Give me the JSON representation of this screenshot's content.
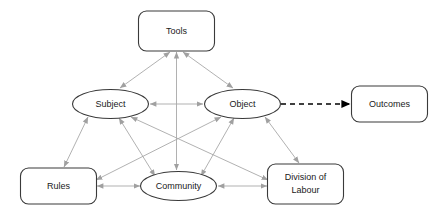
{
  "diagram": {
    "colors": {
      "node_stroke": "#3a3a3a",
      "node_fill": "#ffffff",
      "edge": "#a8a8a8",
      "outcome_edge": "#000000",
      "text": "#1a1a1a",
      "background": "#ffffff"
    },
    "nodes": [
      {
        "id": "tools",
        "label": "Tools",
        "shape": "rounded-rect",
        "x": 176.5,
        "y": 31,
        "w": 76,
        "h": 40
      },
      {
        "id": "subject",
        "label": "Subject",
        "shape": "ellipse",
        "x": 110.5,
        "y": 104,
        "w": 76,
        "h": 29
      },
      {
        "id": "object",
        "label": "Object",
        "shape": "ellipse",
        "x": 242.5,
        "y": 104,
        "w": 76,
        "h": 29
      },
      {
        "id": "outcomes",
        "label": "Outcomes",
        "shape": "rounded-rect",
        "x": 389.5,
        "y": 104,
        "w": 76,
        "h": 36
      },
      {
        "id": "rules",
        "label": "Rules",
        "shape": "rounded-rect",
        "x": 58.5,
        "y": 186,
        "w": 76,
        "h": 36
      },
      {
        "id": "community",
        "label": "Community",
        "shape": "ellipse",
        "x": 178.5,
        "y": 186,
        "w": 76,
        "h": 29
      },
      {
        "id": "division",
        "label": "Division of Labour",
        "shape": "rounded-rect",
        "x": 305.5,
        "y": 184,
        "w": 76,
        "h": 40,
        "label_line1": "Division of",
        "label_line2": "Labour"
      }
    ],
    "edges": [
      {
        "id": "tools-subject",
        "from": "tools",
        "to": "subject",
        "style": "solid",
        "arrows": "both",
        "color": "#a8a8a8"
      },
      {
        "id": "tools-object",
        "from": "tools",
        "to": "object",
        "style": "solid",
        "arrows": "both",
        "color": "#a8a8a8"
      },
      {
        "id": "tools-community",
        "from": "tools",
        "to": "community",
        "style": "solid",
        "arrows": "both",
        "color": "#a8a8a8"
      },
      {
        "id": "subject-object",
        "from": "subject",
        "to": "object",
        "style": "solid",
        "arrows": "both",
        "color": "#a8a8a8"
      },
      {
        "id": "subject-rules",
        "from": "subject",
        "to": "rules",
        "style": "solid",
        "arrows": "both",
        "color": "#a8a8a8"
      },
      {
        "id": "subject-community",
        "from": "subject",
        "to": "community",
        "style": "solid",
        "arrows": "both",
        "color": "#a8a8a8"
      },
      {
        "id": "subject-division",
        "from": "subject",
        "to": "division",
        "style": "solid",
        "arrows": "both",
        "color": "#a8a8a8"
      },
      {
        "id": "object-rules",
        "from": "object",
        "to": "rules",
        "style": "solid",
        "arrows": "both",
        "color": "#a8a8a8"
      },
      {
        "id": "object-community",
        "from": "object",
        "to": "community",
        "style": "solid",
        "arrows": "both",
        "color": "#a8a8a8"
      },
      {
        "id": "object-division",
        "from": "object",
        "to": "division",
        "style": "solid",
        "arrows": "both",
        "color": "#a8a8a8"
      },
      {
        "id": "rules-community",
        "from": "rules",
        "to": "community",
        "style": "solid",
        "arrows": "both",
        "color": "#a8a8a8"
      },
      {
        "id": "community-division",
        "from": "community",
        "to": "division",
        "style": "solid",
        "arrows": "both",
        "color": "#a8a8a8"
      },
      {
        "id": "object-outcomes",
        "from": "object",
        "to": "outcomes",
        "style": "dashed",
        "arrows": "forward",
        "color": "#000000"
      }
    ]
  }
}
